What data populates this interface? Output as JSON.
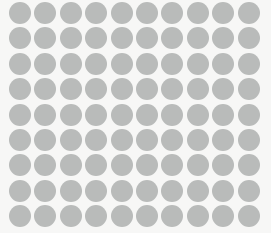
{
  "canvas": {
    "width": 271,
    "height": 233,
    "background_color": "#f7f7f6",
    "title": "Dot Grid Pattern"
  },
  "pattern": {
    "name": "polka-dot-grid",
    "shape": "circle",
    "columns": 10,
    "rows": 9,
    "total_dots": 90,
    "dot_color": "#b9bbba",
    "dot_diameter": 22,
    "pitch_x": 25.4,
    "pitch_y": 25.4,
    "origin_x": 20,
    "origin_y": 13,
    "edge_softness": 0.4
  }
}
